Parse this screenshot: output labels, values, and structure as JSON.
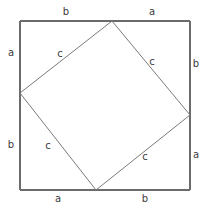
{
  "figure": {
    "name": "pythagorean-theorem-square-diagram",
    "background_color": "#ffffff",
    "line_color": "#6b6b6b",
    "inner_line_color": "#7a7a7a",
    "label_color": "#3c3c3c",
    "outer_square": {
      "x1": 20,
      "y1": 21,
      "x2": 190,
      "y2": 190
    },
    "inner_square_vertices": [
      {
        "id": "top",
        "x": 112,
        "y": 21
      },
      {
        "id": "right",
        "x": 190,
        "y": 115
      },
      {
        "id": "bottom",
        "x": 96,
        "y": 190
      },
      {
        "id": "left",
        "x": 20,
        "y": 93
      }
    ],
    "labels": [
      {
        "id": "top-left-b",
        "text": "b",
        "x": 66,
        "y": 12,
        "side": "top",
        "segment": "left"
      },
      {
        "id": "top-right-a",
        "text": "a",
        "x": 152,
        "y": 12,
        "side": "top",
        "segment": "right"
      },
      {
        "id": "left-top-a",
        "text": "a",
        "x": 11,
        "y": 53,
        "side": "left",
        "segment": "top"
      },
      {
        "id": "left-bottom-b",
        "text": "b",
        "x": 11,
        "y": 145,
        "side": "left",
        "segment": "bottom"
      },
      {
        "id": "right-top-b",
        "text": "b",
        "x": 196,
        "y": 64,
        "side": "right",
        "segment": "top"
      },
      {
        "id": "right-bottom-a",
        "text": "a",
        "x": 196,
        "y": 155,
        "side": "right",
        "segment": "bottom"
      },
      {
        "id": "bottom-left-a",
        "text": "a",
        "x": 58,
        "y": 199,
        "side": "bottom",
        "segment": "left"
      },
      {
        "id": "bottom-right-b",
        "text": "b",
        "x": 145,
        "y": 199,
        "side": "bottom",
        "segment": "right"
      },
      {
        "id": "hypotenuse-top-left-c",
        "text": "c",
        "x": 60,
        "y": 54,
        "side": "inner",
        "segment": "top-left"
      },
      {
        "id": "hypotenuse-top-right-c",
        "text": "c",
        "x": 152,
        "y": 62,
        "side": "inner",
        "segment": "top-right"
      },
      {
        "id": "hypotenuse-bottom-left-c",
        "text": "c",
        "x": 48,
        "y": 146,
        "side": "inner",
        "segment": "bottom-left"
      },
      {
        "id": "hypotenuse-bottom-right-c",
        "text": "c",
        "x": 145,
        "y": 157,
        "side": "inner",
        "segment": "bottom-right"
      }
    ]
  }
}
